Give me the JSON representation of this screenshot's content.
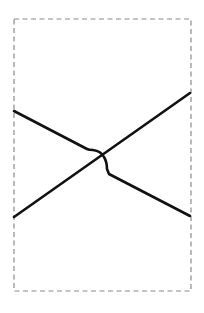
{
  "diagram": {
    "type": "crossing-lines-with-line-jump",
    "canvas": {
      "width": 204,
      "height": 313,
      "background": "#ffffff"
    },
    "frame": {
      "x": 14,
      "y": 19,
      "width": 177,
      "height": 272,
      "stroke": "#8a8a8a",
      "stroke_width": 1.2,
      "dash": "5,3.5"
    },
    "lines": [
      {
        "id": "line-descending",
        "stroke": "#111111",
        "stroke_width": 2.6,
        "path": "M14,111 L87,149 Q89,150 93,150 Q101,151 104,157 Q107,162 107,169 L109,174 L190,216"
      },
      {
        "id": "line-ascending",
        "stroke": "#111111",
        "stroke_width": 2.6,
        "path": "M14,217 L190,93"
      }
    ]
  }
}
